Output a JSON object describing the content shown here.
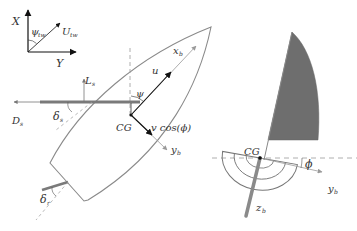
{
  "diagram": {
    "type": "sailboat-kinematics",
    "colors": {
      "hull_outline": "#8a8a8a",
      "sail_fill": "#6e6e6e",
      "arrow_black": "#111111",
      "arrow_gray": "#999999",
      "boom": "#7a7a7a",
      "dashed": "#9a9a9a"
    },
    "inertial_frame": {
      "x_axis": "X",
      "y_axis": "Y",
      "wind_angle": "ψ",
      "wind_angle_sub": "tw",
      "wind_vector": "U",
      "wind_vector_sub": "tw"
    },
    "top_view": {
      "lift": "L",
      "lift_sub": "s",
      "drag": "D",
      "drag_sub": "s",
      "sail_angle": "δ",
      "sail_angle_sub": "s",
      "rudder_angle": "δ",
      "rudder_angle_sub": "r",
      "heading": "ψ",
      "surge": "u",
      "sway": "v cos(ϕ)",
      "cg": "CG",
      "body_x": "x",
      "body_x_sub": "b",
      "body_y": "y",
      "body_y_sub": "b"
    },
    "rear_view": {
      "cg": "CG",
      "heel_angle": "ϕ",
      "body_y": "y",
      "body_y_sub": "b",
      "body_z": "z",
      "body_z_sub": "b"
    }
  }
}
